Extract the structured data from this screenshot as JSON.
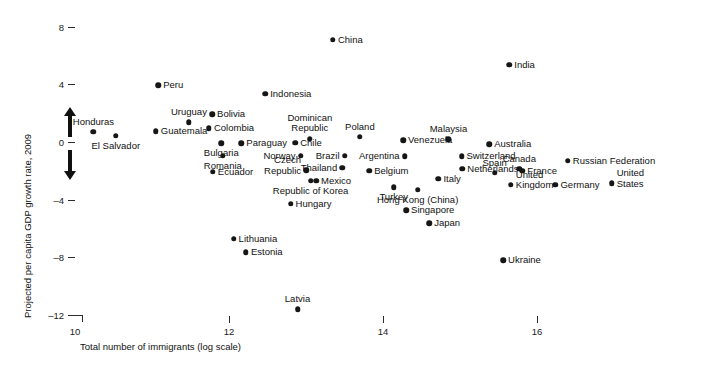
{
  "chart_data": {
    "type": "scatter",
    "title": "",
    "xlabel": "Total number of immigrants (log scale)",
    "ylabel": "Projected per capita GDP growth rate, 2009",
    "xlim": [
      9.6,
      17.1
    ],
    "ylim": [
      -13.0,
      9.2
    ],
    "xticks": [
      10,
      12,
      14,
      16
    ],
    "xticklabels": [
      "10",
      "12",
      "14",
      "16"
    ],
    "yticks": [
      8,
      4,
      0,
      -4,
      -8,
      -12
    ],
    "yticklabels": [
      "8",
      "4",
      "0",
      "–4",
      "–8",
      "–12"
    ],
    "grid": false,
    "legend": null,
    "annotations": [
      {
        "name": "up-arrow",
        "meaning": "higher growth"
      },
      {
        "name": "down-arrow",
        "meaning": "lower growth"
      }
    ],
    "points": [
      {
        "label": "China",
        "x": 13.35,
        "y": 7.1,
        "pos": "right"
      },
      {
        "label": "India",
        "x": 15.64,
        "y": 5.35,
        "pos": "right"
      },
      {
        "label": "Peru",
        "x": 11.08,
        "y": 3.95,
        "pos": "right"
      },
      {
        "label": "Indonesia",
        "x": 12.47,
        "y": 3.35,
        "pos": "right"
      },
      {
        "label": "Bolivia",
        "x": 11.78,
        "y": 1.93,
        "pos": "right"
      },
      {
        "label": "Uruguay",
        "x": 11.48,
        "y": 1.37,
        "pos": "above"
      },
      {
        "label": "Colombia",
        "x": 11.74,
        "y": 0.95,
        "pos": "right"
      },
      {
        "label": "Guatemala",
        "x": 11.05,
        "y": 0.75,
        "pos": "right"
      },
      {
        "label": "Honduras",
        "x": 10.24,
        "y": 0.7,
        "pos": "above"
      },
      {
        "label": "El Salvador",
        "x": 10.53,
        "y": 0.42,
        "pos": "below"
      },
      {
        "label": "Dominican\nRepublic",
        "x": 13.05,
        "y": 0.22,
        "pos": "above"
      },
      {
        "label": "Poland",
        "x": 13.7,
        "y": 0.35,
        "pos": "above"
      },
      {
        "label": "Venezuela",
        "x": 14.26,
        "y": 0.12,
        "pos": "right"
      },
      {
        "label": "Malaysia",
        "x": 14.85,
        "y": 0.2,
        "pos": "above"
      },
      {
        "label": "Australia",
        "x": 15.38,
        "y": -0.15,
        "pos": "right"
      },
      {
        "label": "Chile",
        "x": 12.86,
        "y": -0.05,
        "pos": "right"
      },
      {
        "label": "Bulgaria",
        "x": 11.9,
        "y": -0.1,
        "pos": "below"
      },
      {
        "label": "Paraguay",
        "x": 12.16,
        "y": -0.1,
        "pos": "right"
      },
      {
        "label": "Norway",
        "x": 12.93,
        "y": -0.95,
        "pos": "left"
      },
      {
        "label": "Brazil",
        "x": 13.5,
        "y": -0.95,
        "pos": "left"
      },
      {
        "label": "Argentina",
        "x": 14.28,
        "y": -1.0,
        "pos": "left"
      },
      {
        "label": "Switzerland",
        "x": 15.02,
        "y": -1.0,
        "pos": "right"
      },
      {
        "label": "Canada",
        "x": 15.77,
        "y": -1.85,
        "pos": "above"
      },
      {
        "label": "France",
        "x": 15.81,
        "y": -2.0,
        "pos": "right"
      },
      {
        "label": "Spain",
        "x": 15.45,
        "y": -2.15,
        "pos": "above"
      },
      {
        "label": "Russian Federation",
        "x": 16.4,
        "y": -1.3,
        "pos": "right"
      },
      {
        "label": "Romania",
        "x": 11.92,
        "y": -0.95,
        "pos": "below"
      },
      {
        "label": "Thailand",
        "x": 13.47,
        "y": -1.8,
        "pos": "left"
      },
      {
        "label": "Netherlands",
        "x": 15.03,
        "y": -1.85,
        "pos": "right"
      },
      {
        "label": "Czech\nRepublic",
        "x": 13.0,
        "y": -1.95,
        "pos": "left"
      },
      {
        "label": "Belgium",
        "x": 13.82,
        "y": -2.0,
        "pos": "right"
      },
      {
        "label": "Italy",
        "x": 14.72,
        "y": -2.55,
        "pos": "right"
      },
      {
        "label": "United\nKingdom",
        "x": 15.66,
        "y": -2.95,
        "pos": "right"
      },
      {
        "label": "Germany",
        "x": 16.24,
        "y": -2.95,
        "pos": "right"
      },
      {
        "label": "United\nStates",
        "x": 16.97,
        "y": -2.85,
        "pos": "right"
      },
      {
        "label": "Ecuador",
        "x": 11.79,
        "y": -2.05,
        "pos": "right"
      },
      {
        "label": "Mexico",
        "x": 13.13,
        "y": -2.7,
        "pos": "right"
      },
      {
        "label": "Republic of Korea",
        "x": 13.06,
        "y": -2.7,
        "pos": "below"
      },
      {
        "label": "Turkey",
        "x": 14.14,
        "y": -3.15,
        "pos": "below"
      },
      {
        "label": "Hong Kong (China)",
        "x": 14.45,
        "y": -3.3,
        "pos": "below"
      },
      {
        "label": "Hungary",
        "x": 12.8,
        "y": -4.3,
        "pos": "right"
      },
      {
        "label": "Singapore",
        "x": 14.3,
        "y": -4.75,
        "pos": "right"
      },
      {
        "label": "Japan",
        "x": 14.6,
        "y": -5.65,
        "pos": "right"
      },
      {
        "label": "Lithuania",
        "x": 12.06,
        "y": -6.7,
        "pos": "right"
      },
      {
        "label": "Estonia",
        "x": 12.22,
        "y": -7.65,
        "pos": "right"
      },
      {
        "label": "Ukraine",
        "x": 15.56,
        "y": -8.2,
        "pos": "right"
      },
      {
        "label": "Latvia",
        "x": 12.89,
        "y": -11.6,
        "pos": "above"
      }
    ]
  },
  "axes": {
    "x_title": "Total number of immigrants (log scale)",
    "y_title": "Projected per capita GDP growth rate, 2009"
  }
}
